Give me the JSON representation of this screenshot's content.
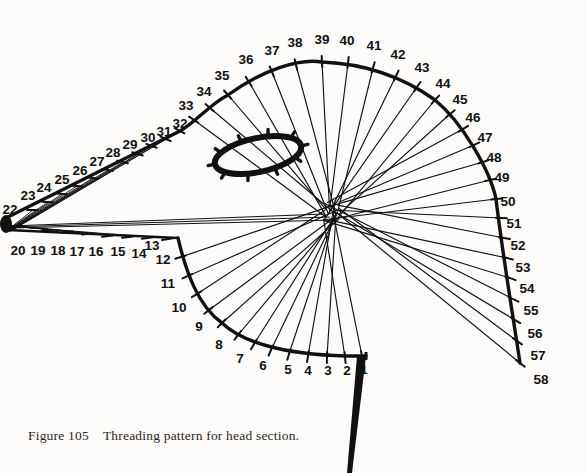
{
  "figure": {
    "caption_label": "Figure 105",
    "caption_text": "Threading pattern for head section.",
    "background_color": "#fdfcfa",
    "ink_color": "#111111"
  },
  "diagram": {
    "title": "Threading pattern for head section",
    "type": "technical-line-diagram",
    "hub": {
      "x": 331,
      "y": 212
    },
    "apex_marker": {
      "x": 6,
      "y": 224
    },
    "guide_ring": {
      "name": "thread-guide-ring",
      "cx": 258,
      "cy": 155,
      "rx": 44,
      "ry": 17,
      "rotation": -12,
      "spurs": 10
    },
    "stem": {
      "name": "tapered-stem",
      "from_x": 366,
      "from_y": 356,
      "to_x": 352,
      "to_y": 473,
      "width_top": 9,
      "width_bottom": 5
    },
    "corner_lower_left": {
      "x": 178,
      "y": 238
    },
    "corner_lower_right": {
      "x": 366,
      "y": 356
    },
    "arc_crown": {
      "x": 330,
      "y": 62
    },
    "positions": [
      {
        "n": "1",
        "x": 362,
        "y": 356,
        "lx": 364,
        "ly": 374,
        "tick": 1
      },
      {
        "n": "2",
        "x": 345,
        "y": 357,
        "lx": 347,
        "ly": 375,
        "tick": 1
      },
      {
        "n": "3",
        "x": 327,
        "y": 357,
        "lx": 328,
        "ly": 375,
        "tick": 1
      },
      {
        "n": "4",
        "x": 308,
        "y": 356,
        "lx": 308,
        "ly": 375,
        "tick": 1
      },
      {
        "n": "5",
        "x": 289,
        "y": 354,
        "lx": 288,
        "ly": 374,
        "tick": 1
      },
      {
        "n": "6",
        "x": 271,
        "y": 350,
        "lx": 263,
        "ly": 370,
        "tick": 1
      },
      {
        "n": "7",
        "x": 254,
        "y": 344,
        "lx": 240,
        "ly": 363,
        "tick": 1
      },
      {
        "n": "8",
        "x": 238,
        "y": 335,
        "lx": 219,
        "ly": 349,
        "tick": 1
      },
      {
        "n": "9",
        "x": 222,
        "y": 323,
        "lx": 199,
        "ly": 331,
        "tick": 1
      },
      {
        "n": "10",
        "x": 209,
        "y": 310,
        "lx": 179,
        "ly": 312,
        "tick": 1
      },
      {
        "n": "11",
        "x": 197,
        "y": 294,
        "lx": 168,
        "ly": 288,
        "tick": 1
      },
      {
        "n": "12",
        "x": 188,
        "y": 276,
        "lx": 163,
        "ly": 264,
        "tick": 1
      },
      {
        "n": "13",
        "x": 181,
        "y": 257,
        "lx": 152,
        "ly": 250,
        "tick": 1
      },
      {
        "n": "14",
        "x": 168,
        "y": 239,
        "lx": 139,
        "ly": 258,
        "tick": 1
      },
      {
        "n": "15",
        "x": 148,
        "y": 238,
        "lx": 118,
        "ly": 256,
        "tick": 1
      },
      {
        "n": "16",
        "x": 128,
        "y": 237,
        "lx": 96,
        "ly": 256,
        "tick": 1
      },
      {
        "n": "17",
        "x": 108,
        "y": 236,
        "lx": 77,
        "ly": 256,
        "tick": 1
      },
      {
        "n": "18",
        "x": 88,
        "y": 234,
        "lx": 58,
        "ly": 255,
        "tick": 1
      },
      {
        "n": "19",
        "x": 68,
        "y": 232,
        "lx": 38,
        "ly": 255,
        "tick": 1
      },
      {
        "n": "20",
        "x": 48,
        "y": 230,
        "lx": 18,
        "ly": 255,
        "tick": 1
      },
      {
        "n": "22",
        "x": 33,
        "y": 210,
        "lx": 10,
        "ly": 214,
        "tick": 1
      },
      {
        "n": "23",
        "x": 48,
        "y": 202,
        "lx": 28,
        "ly": 200,
        "tick": 1
      },
      {
        "n": "24",
        "x": 62,
        "y": 194,
        "lx": 44,
        "ly": 192,
        "tick": 1
      },
      {
        "n": "25",
        "x": 77,
        "y": 186,
        "lx": 62,
        "ly": 184,
        "tick": 1
      },
      {
        "n": "26",
        "x": 93,
        "y": 178,
        "lx": 80,
        "ly": 175,
        "tick": 1
      },
      {
        "n": "27",
        "x": 108,
        "y": 170,
        "lx": 97,
        "ly": 166,
        "tick": 1
      },
      {
        "n": "28",
        "x": 123,
        "y": 162,
        "lx": 113,
        "ly": 157,
        "tick": 1
      },
      {
        "n": "29",
        "x": 138,
        "y": 154,
        "lx": 130,
        "ly": 149,
        "tick": 1
      },
      {
        "n": "30",
        "x": 152,
        "y": 146,
        "lx": 148,
        "ly": 142,
        "tick": 1
      },
      {
        "n": "31",
        "x": 166,
        "y": 139,
        "lx": 164,
        "ly": 136,
        "tick": 1
      },
      {
        "n": "32",
        "x": 180,
        "y": 131,
        "lx": 180,
        "ly": 128,
        "tick": 1
      },
      {
        "n": "33",
        "x": 194,
        "y": 120,
        "lx": 186,
        "ly": 110,
        "tick": 1
      },
      {
        "n": "34",
        "x": 210,
        "y": 108,
        "lx": 204,
        "ly": 96,
        "tick": 1
      },
      {
        "n": "35",
        "x": 228,
        "y": 95,
        "lx": 222,
        "ly": 80,
        "tick": 1
      },
      {
        "n": "36",
        "x": 249,
        "y": 82,
        "lx": 246,
        "ly": 64,
        "tick": 1
      },
      {
        "n": "37",
        "x": 272,
        "y": 72,
        "lx": 272,
        "ly": 55,
        "tick": 1
      },
      {
        "n": "38",
        "x": 296,
        "y": 65,
        "lx": 295,
        "ly": 47,
        "tick": 1
      },
      {
        "n": "39",
        "x": 322,
        "y": 62,
        "lx": 322,
        "ly": 44,
        "tick": 1
      },
      {
        "n": "40",
        "x": 348,
        "y": 63,
        "lx": 347,
        "ly": 45,
        "tick": 1
      },
      {
        "n": "41",
        "x": 373,
        "y": 68,
        "lx": 374,
        "ly": 50,
        "tick": 1
      },
      {
        "n": "42",
        "x": 396,
        "y": 76,
        "lx": 398,
        "ly": 59,
        "tick": 1
      },
      {
        "n": "43",
        "x": 417,
        "y": 87,
        "lx": 422,
        "ly": 72,
        "tick": 1
      },
      {
        "n": "44",
        "x": 435,
        "y": 100,
        "lx": 443,
        "ly": 88,
        "tick": 1
      },
      {
        "n": "45",
        "x": 450,
        "y": 114,
        "lx": 460,
        "ly": 104,
        "tick": 1
      },
      {
        "n": "46",
        "x": 463,
        "y": 129,
        "lx": 473,
        "ly": 122,
        "tick": 1
      },
      {
        "n": "47",
        "x": 474,
        "y": 145,
        "lx": 485,
        "ly": 142,
        "tick": 1
      },
      {
        "n": "48",
        "x": 483,
        "y": 162,
        "lx": 494,
        "ly": 162,
        "tick": 1
      },
      {
        "n": "49",
        "x": 490,
        "y": 180,
        "lx": 502,
        "ly": 182,
        "tick": 1
      },
      {
        "n": "50",
        "x": 496,
        "y": 199,
        "lx": 508,
        "ly": 206,
        "tick": 1
      },
      {
        "n": "51",
        "x": 501,
        "y": 218,
        "lx": 514,
        "ly": 228,
        "tick": 1
      },
      {
        "n": "52",
        "x": 504,
        "y": 238,
        "lx": 518,
        "ly": 250,
        "tick": 1
      },
      {
        "n": "53",
        "x": 507,
        "y": 258,
        "lx": 523,
        "ly": 272,
        "tick": 1
      },
      {
        "n": "54",
        "x": 510,
        "y": 278,
        "lx": 527,
        "ly": 293,
        "tick": 1
      },
      {
        "n": "55",
        "x": 513,
        "y": 299,
        "lx": 531,
        "ly": 315,
        "tick": 1
      },
      {
        "n": "56",
        "x": 515,
        "y": 320,
        "lx": 535,
        "ly": 338,
        "tick": 1
      },
      {
        "n": "57",
        "x": 517,
        "y": 341,
        "lx": 538,
        "ly": 360,
        "tick": 1
      },
      {
        "n": "58",
        "x": 520,
        "y": 363,
        "lx": 541,
        "ly": 384,
        "tick": 1
      }
    ],
    "thread_line_targets": [
      "1",
      "2",
      "3",
      "4",
      "5",
      "6",
      "7",
      "8",
      "9",
      "10",
      "11",
      "12",
      "13",
      "33",
      "34",
      "35",
      "36",
      "37",
      "38",
      "39",
      "40",
      "41",
      "42",
      "43",
      "44",
      "45",
      "46",
      "47",
      "48",
      "49",
      "50",
      "51",
      "52",
      "53",
      "54",
      "55",
      "56",
      "57",
      "58"
    ],
    "fan_line_targets_left": [
      "22",
      "23",
      "24",
      "25",
      "26",
      "27",
      "28",
      "29",
      "30",
      "31",
      "32"
    ]
  }
}
